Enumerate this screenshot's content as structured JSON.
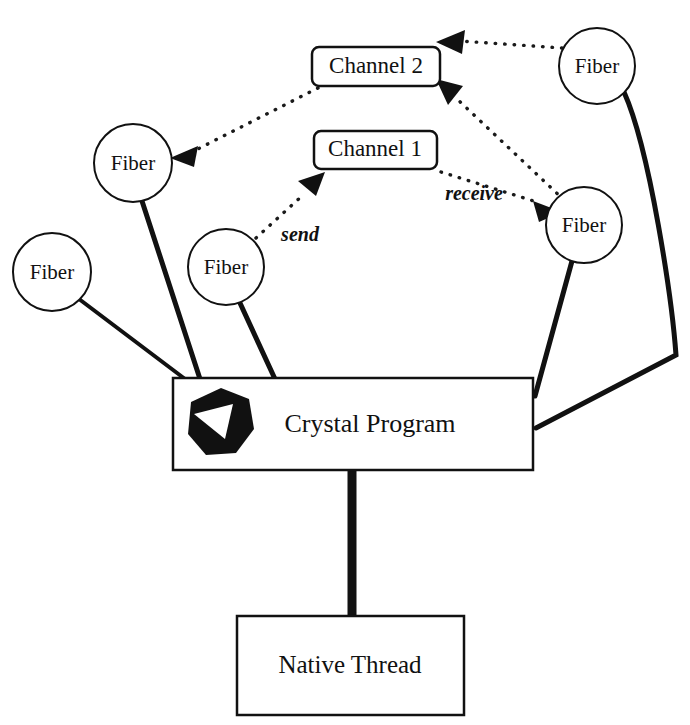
{
  "diagram": {
    "colors": {
      "stroke": "#111111",
      "fill": "#ffffff",
      "background": "#ffffff"
    },
    "nodes": {
      "fibers": [
        {
          "id": "fiber-1",
          "label": "Fiber",
          "cx": 52,
          "cy": 272,
          "r": 39
        },
        {
          "id": "fiber-2",
          "label": "Fiber",
          "cx": 133,
          "cy": 163,
          "r": 39
        },
        {
          "id": "fiber-3",
          "label": "Fiber",
          "cx": 226,
          "cy": 267,
          "r": 38
        },
        {
          "id": "fiber-4",
          "label": "Fiber",
          "cx": 597,
          "cy": 66,
          "r": 38
        },
        {
          "id": "fiber-5",
          "label": "Fiber",
          "cx": 584,
          "cy": 225,
          "r": 38
        }
      ],
      "channels": [
        {
          "id": "channel-2",
          "label": "Channel 2",
          "x": 312,
          "y": 47,
          "w": 128,
          "h": 39
        },
        {
          "id": "channel-1",
          "label": "Channel 1",
          "x": 314,
          "y": 131,
          "w": 123,
          "h": 38
        }
      ],
      "program": {
        "id": "crystal-program",
        "label": "Crystal Program",
        "x": 173,
        "y": 378,
        "w": 360,
        "h": 92
      },
      "thread": {
        "id": "native-thread",
        "label": "Native Thread",
        "x": 237,
        "y": 616,
        "w": 227,
        "h": 99
      }
    },
    "edge_labels": [
      {
        "id": "send-label",
        "text": "send",
        "x": 300,
        "y": 236
      },
      {
        "id": "receive-label",
        "text": "receive",
        "x": 474,
        "y": 195
      }
    ],
    "edges": [
      {
        "id": "fiber-1-to-program",
        "style": "solid",
        "from": "fiber-1",
        "to": "crystal-program"
      },
      {
        "id": "fiber-2-to-program",
        "style": "solid",
        "from": "fiber-2",
        "to": "crystal-program"
      },
      {
        "id": "fiber-3-to-program",
        "style": "solid",
        "from": "fiber-3",
        "to": "crystal-program"
      },
      {
        "id": "fiber-4-to-program",
        "style": "solid",
        "from": "fiber-4",
        "to": "crystal-program"
      },
      {
        "id": "fiber-5-to-program",
        "style": "solid",
        "from": "fiber-5",
        "to": "crystal-program"
      },
      {
        "id": "program-to-thread",
        "style": "solid",
        "from": "crystal-program",
        "to": "native-thread"
      },
      {
        "id": "channel-2-to-fiber-2",
        "style": "dotted",
        "from": "channel-2",
        "to": "fiber-2"
      },
      {
        "id": "fiber-4-to-channel-2",
        "style": "dotted",
        "from": "fiber-4",
        "to": "channel-2"
      },
      {
        "id": "fiber-5-to-channel-2",
        "style": "dotted",
        "from": "fiber-5",
        "to": "channel-2"
      },
      {
        "id": "fiber-3-to-channel-1",
        "style": "dotted",
        "from": "fiber-3",
        "to": "channel-1",
        "label": "send"
      },
      {
        "id": "channel-1-to-fiber-5",
        "style": "dotted",
        "from": "channel-1",
        "to": "fiber-5",
        "label": "receive"
      }
    ],
    "logo": {
      "id": "crystal-logo",
      "name": "crystal-gem-icon",
      "cx": 219,
      "cy": 423
    }
  }
}
